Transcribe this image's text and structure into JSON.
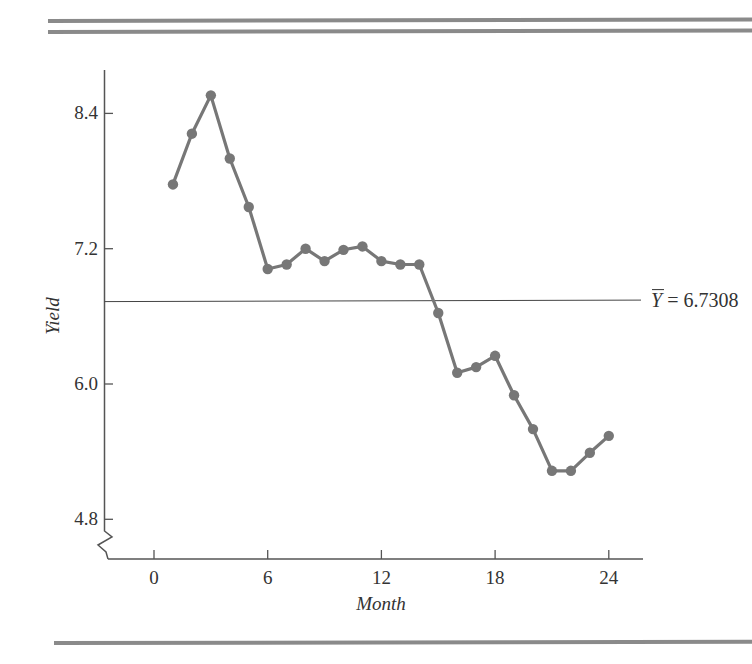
{
  "chart_data": {
    "type": "line",
    "title": "",
    "xlabel": "Month",
    "ylabel": "Yield",
    "x_ticks": [
      0,
      6,
      12,
      18,
      24
    ],
    "x_tick_labels": [
      "0",
      "6",
      "12",
      "18",
      "24"
    ],
    "y_ticks": [
      4.8,
      6.0,
      7.2,
      8.4
    ],
    "y_tick_labels": [
      "4.8",
      "6.0",
      "7.2",
      "8.4"
    ],
    "xlim": [
      -2.6,
      26.0
    ],
    "ylim": [
      4.4,
      8.9
    ],
    "y_axis_break": true,
    "grid": false,
    "legend": null,
    "series": [
      {
        "name": "Yield",
        "x": [
          1,
          2,
          3,
          4,
          5,
          6,
          7,
          8,
          9,
          10,
          11,
          12,
          13,
          14,
          15,
          16,
          17,
          18,
          19,
          20,
          21,
          22,
          23,
          24
        ],
        "values": [
          7.77,
          8.22,
          8.56,
          8.0,
          7.57,
          7.02,
          7.06,
          7.2,
          7.09,
          7.19,
          7.22,
          7.09,
          7.06,
          7.06,
          6.63,
          6.1,
          6.15,
          6.25,
          5.9,
          5.6,
          5.23,
          5.23,
          5.39,
          5.54
        ],
        "marker": "circle",
        "color": "#777777"
      }
    ],
    "reference_lines": [
      {
        "orientation": "horizontal",
        "y": 6.7308,
        "label_symbol": "Y",
        "label_text": " = 6.7308",
        "label": "Ȳ = 6.7308"
      }
    ]
  },
  "colors": {
    "series": "#777777",
    "axis": "#555555",
    "text": "#333333",
    "rule": "#8a8a8a"
  }
}
